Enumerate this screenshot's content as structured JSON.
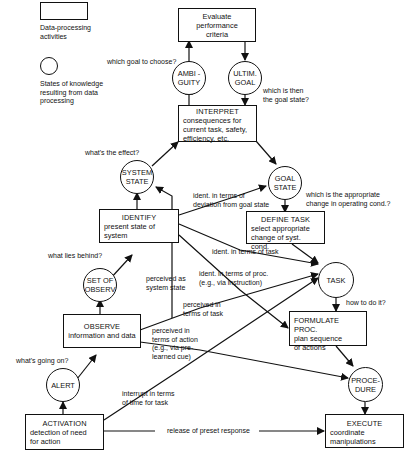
{
  "legend": {
    "box_label": "Data-processing activities",
    "box_label_lines": [
      "Data-processing",
      "activities"
    ],
    "circle_label_lines": [
      "States of knowledge",
      "resulting from data",
      "processing"
    ]
  },
  "activities": {
    "evaluate": {
      "lines": [
        "Evaluate",
        "performance",
        "criteria"
      ]
    },
    "interpret": {
      "title": "INTERPRET",
      "lines": [
        "consequences for",
        "current task, safety,",
        "efficiency, etc."
      ]
    },
    "identify": {
      "title": "IDENTIFY",
      "lines": [
        "present state of",
        "system"
      ]
    },
    "define_task": {
      "title": "DEFINE TASK",
      "lines": [
        "select appropriate",
        "change of syst. cond."
      ]
    },
    "observe": {
      "title": "OBSERVE",
      "lines": [
        "information and data"
      ]
    },
    "formulate": {
      "title": "FORMULATE PROC.",
      "lines": [
        "plan sequence",
        "of actions"
      ]
    },
    "activation": {
      "title": "ACTIVATION",
      "lines": [
        "detection of need",
        "for action"
      ]
    },
    "execute": {
      "title": "EXECUTE",
      "lines": [
        "coordinate",
        "manipulations"
      ]
    }
  },
  "states": {
    "ambiguity": {
      "lines": [
        "AMBI -",
        "GUITY"
      ]
    },
    "ultimate_goal": {
      "lines": [
        "ULTIM.",
        "GOAL"
      ]
    },
    "system_state": {
      "lines": [
        "SYSTEM",
        "STATE"
      ]
    },
    "goal_state": {
      "lines": [
        "GOAL",
        "STATE"
      ]
    },
    "set_of_observ": {
      "lines": [
        "SET OF",
        "OBSERV"
      ]
    },
    "task": {
      "lines": [
        "TASK"
      ]
    },
    "alert": {
      "lines": [
        "ALERT"
      ]
    },
    "procedure": {
      "lines": [
        "PROCE-",
        "DURE"
      ]
    }
  },
  "questions": {
    "which_goal": "which goal to choose?",
    "which_goal_state": [
      "which is then",
      "the goal state?"
    ],
    "whats_effect": "what's the effect?",
    "appropriate_change": [
      "which is the appropriate",
      "change in operating cond.?"
    ],
    "what_lies_behind": "what lies behind?",
    "how_to_do": "how to do it?",
    "whats_going_on": "what's going on?"
  },
  "edge_labels": {
    "ident_deviation": [
      "ident. in terms of",
      "deviation from goal state"
    ],
    "ident_task": "ident. in terms of task",
    "ident_proc": [
      "ident. in terms of proc.",
      "(e.g., via instruction)"
    ],
    "perceived_system_state": [
      "perceived as",
      "system state"
    ],
    "perceived_task": [
      "perceived in",
      "terms of task"
    ],
    "perceived_action": [
      "perceived in",
      "terms of action",
      "(e.g., via pre-",
      "learned cue)"
    ],
    "interrupt": [
      "interrupt in terms",
      "of time for task"
    ],
    "release": "release of preset response"
  }
}
